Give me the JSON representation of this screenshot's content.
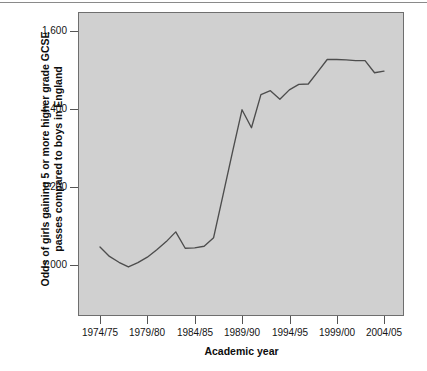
{
  "chart_data": {
    "type": "line",
    "title": "",
    "xlabel": "Academic year",
    "ylabel": "Odds of girls gaining 5 or more higher grade GCSE passes compared to boys in England",
    "ylabel_line1": "Odds of girls gaining 5 or more higher grade GCSE",
    "ylabel_line2": "passes compared to boys in England",
    "grid": false,
    "legend": "none",
    "plot_background_color": "#d0d0d0",
    "line_color": "#4d4d4d",
    "ylim": [
      0.87,
      1.65
    ],
    "xlim": [
      "1974/75",
      "2005/06"
    ],
    "y_ticks": [
      "1.000",
      "1.200",
      "1.400",
      "1.600"
    ],
    "y_tick_values": [
      1.0,
      1.2,
      1.4,
      1.6
    ],
    "x_ticks": [
      "1974/75",
      "1979/80",
      "1984/85",
      "1989/90",
      "1994/95",
      "1999/00",
      "2004/05"
    ],
    "categories": [
      "1974/75",
      "1975/76",
      "1976/77",
      "1977/78",
      "1978/79",
      "1979/80",
      "1980/81",
      "1981/82",
      "1982/83",
      "1983/84",
      "1984/85",
      "1985/86",
      "1986/87",
      "1987/88",
      "1988/89",
      "1989/90",
      "1990/91",
      "1991/92",
      "1992/93",
      "1993/94",
      "1994/95",
      "1995/96",
      "1996/97",
      "1997/98",
      "1998/99",
      "1999/00",
      "2000/01",
      "2001/02",
      "2002/03",
      "2003/04",
      "2004/05"
    ],
    "series": [
      {
        "name": "Odds ratio girls vs boys",
        "values": [
          1.046,
          1.022,
          1.007,
          0.995,
          1.006,
          1.02,
          1.039,
          1.06,
          1.085,
          1.043,
          1.044,
          1.048,
          1.07,
          1.18,
          1.29,
          1.398,
          1.352,
          1.437,
          1.447,
          1.425,
          1.449,
          1.463,
          1.464,
          1.495,
          1.527,
          1.527,
          1.526,
          1.524,
          1.524,
          1.493,
          1.497
        ]
      }
    ]
  },
  "axis": {
    "y_title_line1": "Odds of girls gaining 5 or more higher grade GCSE",
    "y_title_line2": "passes compared to boys in England",
    "x_title": "Academic year"
  }
}
